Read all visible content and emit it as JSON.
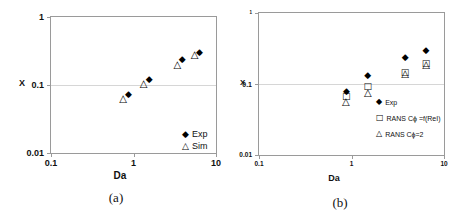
{
  "figure": {
    "background": "#ffffff",
    "axis_color": "#9a9a9a",
    "gridline_color": "#d6d6d6",
    "marker_color": "#000000"
  },
  "chart_data": [
    {
      "id": "a",
      "type": "scatter",
      "caption": "(a)",
      "xlabel": "Da",
      "ylabel": "X",
      "xscale": "log",
      "yscale": "log",
      "xlim": [
        0.1,
        10
      ],
      "ylim": [
        0.01,
        1
      ],
      "x_ticks": [
        "0.1",
        "1",
        "10"
      ],
      "y_ticks": [
        "1",
        "0.1",
        "0.01"
      ],
      "gridlines_y": [
        0.1
      ],
      "legend_position": "inside-bottom-right",
      "series": [
        {
          "name": "Exp",
          "marker": "filled-diamond",
          "points": [
            [
              0.87,
              0.072
            ],
            [
              1.55,
              0.12
            ],
            [
              3.9,
              0.23
            ],
            [
              6.3,
              0.3
            ]
          ]
        },
        {
          "name": "Sim",
          "marker": "open-triangle",
          "points": [
            [
              0.75,
              0.063
            ],
            [
              1.33,
              0.103
            ],
            [
              3.4,
              0.195
            ],
            [
              5.5,
              0.28
            ]
          ]
        }
      ]
    },
    {
      "id": "b",
      "type": "scatter",
      "caption": "(b)",
      "xlabel": "Da",
      "ylabel": "X",
      "xscale": "log",
      "yscale": "log",
      "xlim": [
        0.1,
        10
      ],
      "ylim": [
        0.01,
        1
      ],
      "x_ticks": [
        "0.1",
        "1",
        "10"
      ],
      "y_ticks": [
        "1",
        "0.1",
        "0.01"
      ],
      "gridlines_y": [
        0.1
      ],
      "legend_position": "inside-middle-right",
      "series": [
        {
          "name": "Exp",
          "marker": "filled-diamond",
          "points": [
            [
              0.88,
              0.076
            ],
            [
              1.5,
              0.128
            ],
            [
              3.8,
              0.235
            ],
            [
              6.4,
              0.29
            ]
          ]
        },
        {
          "name": "RANS Cϕ =f(ReI)",
          "marker": "open-square",
          "points": [
            [
              0.88,
              0.065
            ],
            [
              1.5,
              0.09
            ],
            [
              3.8,
              0.145
            ],
            [
              6.4,
              0.19
            ]
          ]
        },
        {
          "name": "RANS Cϕ=2",
          "marker": "open-triangle",
          "points": [
            [
              0.87,
              0.056
            ],
            [
              1.5,
              0.075
            ],
            [
              3.8,
              0.14
            ],
            [
              6.4,
              0.185
            ]
          ]
        }
      ]
    }
  ]
}
